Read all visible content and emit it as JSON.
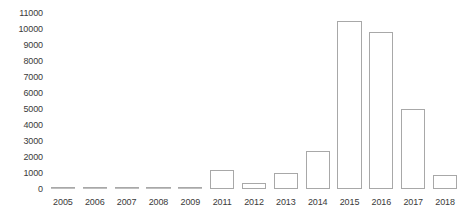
{
  "chart_data": {
    "type": "bar",
    "title": "",
    "subtitle": "",
    "xlabel": "",
    "ylabel": "",
    "categories": [
      "2005",
      "2006",
      "2007",
      "2008",
      "2009",
      "2011",
      "2012",
      "2013",
      "2014",
      "2015",
      "2016",
      "2017",
      "2018"
    ],
    "values": [
      0,
      0,
      0,
      0,
      0,
      1200,
      400,
      1000,
      2350,
      10500,
      9800,
      5000,
      900
    ],
    "ylim": [
      0,
      11000
    ],
    "ytick_values": [
      0,
      1000,
      2000,
      3000,
      4000,
      5000,
      6000,
      7000,
      8000,
      9000,
      10000,
      11000
    ],
    "ytick_labels": [
      "0",
      "1000",
      "2000",
      "3000",
      "4000",
      "5000",
      "6000",
      "7000",
      "8000",
      "9000",
      "10000",
      "11000"
    ],
    "grid": false,
    "legend": false,
    "legend_position": "none",
    "bar_fill_color": "#ffffff",
    "bar_border_color": "#a8a8a8",
    "tick_label_color": "#3a3a3a",
    "background_color": "#ffffff"
  }
}
